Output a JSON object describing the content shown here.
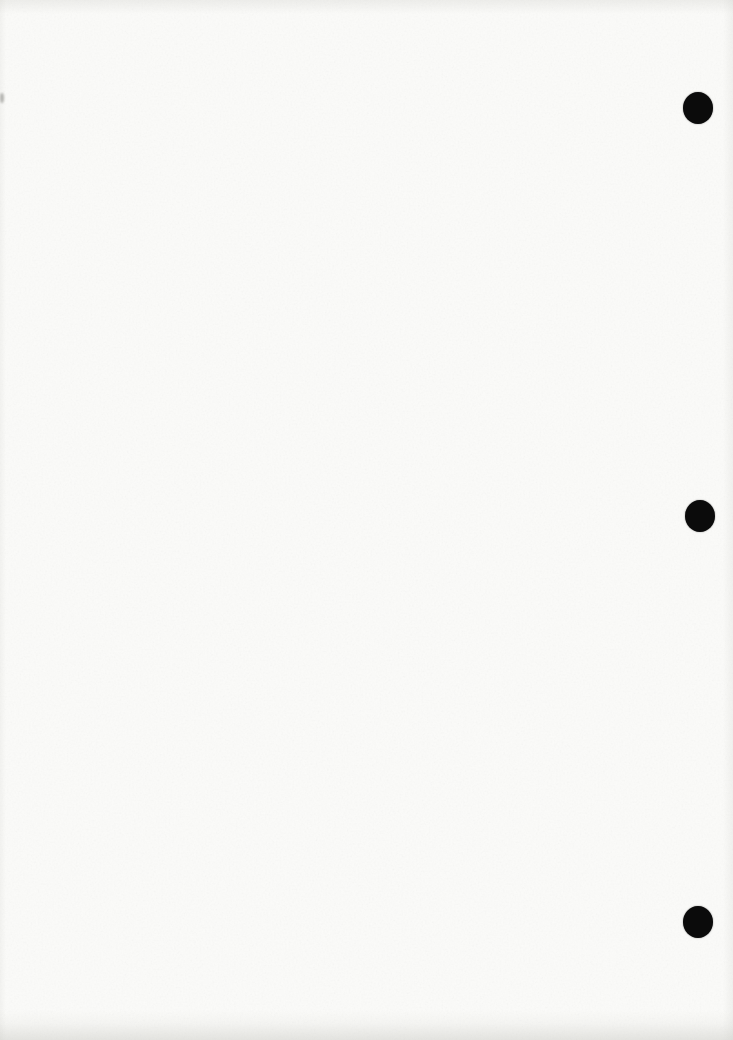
{
  "document": {
    "kind": "blank-scanned-page",
    "page_width": 733,
    "page_height": 1040,
    "paper_color": "#fbfbf9",
    "hole_color": "#0b0b0b",
    "punch_holes": [
      {
        "cx": 698,
        "cy": 108,
        "rx": 15,
        "ry": 16
      },
      {
        "cx": 700,
        "cy": 516,
        "rx": 15,
        "ry": 16
      },
      {
        "cx": 698,
        "cy": 922,
        "rx": 15,
        "ry": 16
      }
    ],
    "edge_smudge": {
      "x": 0,
      "y": 93,
      "width": 4,
      "height": 10,
      "color": "#9a9a96"
    }
  }
}
